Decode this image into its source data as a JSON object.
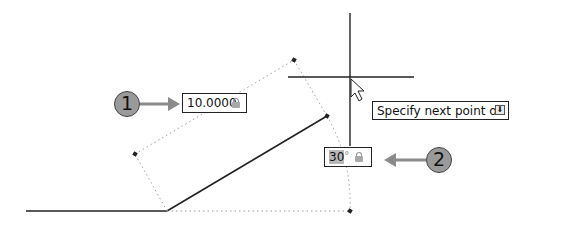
{
  "drawing": {
    "length_input": {
      "value": "10.0000",
      "icon": "lock-icon"
    },
    "angle_input": {
      "value": "30",
      "unit": "°",
      "icon": "lock-icon"
    },
    "prompt_tooltip": {
      "text": "Specify next point or",
      "icon": "dropdown-arrow-icon",
      "icon_glyph": "⬇"
    },
    "callouts": [
      {
        "number": "1",
        "target": "length_input"
      },
      {
        "number": "2",
        "target": "angle_input"
      }
    ],
    "cursor": {
      "type": "crosshair-with-arrow",
      "x": 350,
      "y": 77
    }
  },
  "colors": {
    "line": "#222222",
    "dotted": "#9a9a9a",
    "callout_fill": "#9a9a9a",
    "arrow": "#8a8a8a"
  }
}
